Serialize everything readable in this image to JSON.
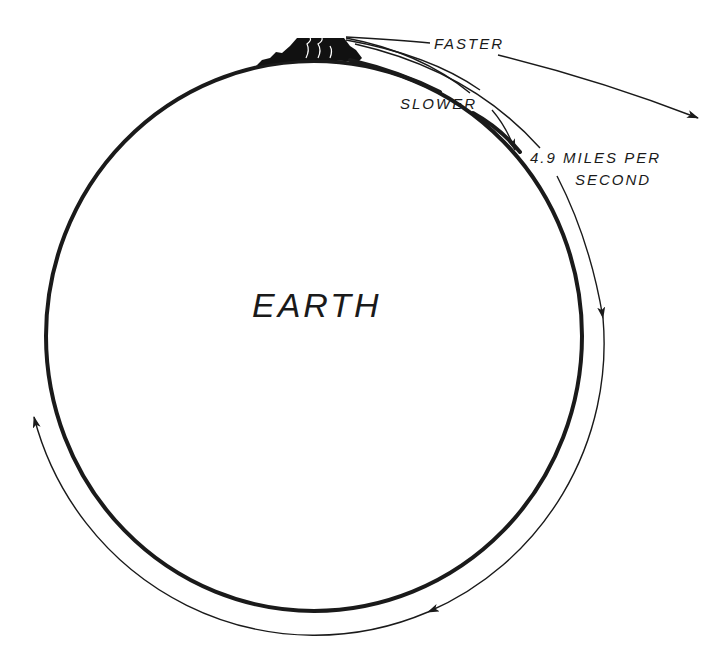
{
  "diagram": {
    "type": "orbital-velocity-illustration",
    "labels": {
      "earth": "EARTH",
      "faster": "FASTER",
      "slower": "SLOWER",
      "speed_line1": "4.9 MILES PER",
      "speed_line2": "SECOND"
    },
    "elements": {
      "planet": "earth-circle",
      "launch_site": "mountain",
      "trajectories": [
        "slower-trajectory",
        "orbital-trajectory",
        "faster-trajectory"
      ],
      "orbit_direction": "clockwise"
    },
    "colors": {
      "ink": "#1a1a1a",
      "background": "#ffffff"
    }
  }
}
